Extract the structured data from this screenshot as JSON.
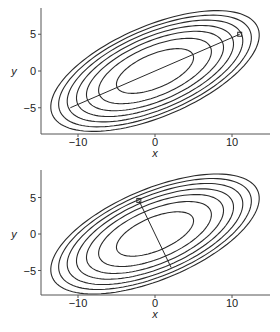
{
  "chart_data": [
    {
      "type": "contour",
      "title": "",
      "xlabel": "x",
      "ylabel": "y",
      "xlim": [
        -14.8,
        14.9
      ],
      "ylim": [
        -8.5,
        8.5
      ],
      "xticks": [
        -10,
        0,
        10
      ],
      "xtick_labels": [
        "−10",
        "0",
        "10"
      ],
      "yticks": [
        -5,
        0,
        5
      ],
      "ytick_labels": [
        "−5",
        "0",
        "5"
      ],
      "grid": false,
      "ellipses": {
        "center": [
          0,
          0
        ],
        "angle_deg": 24.4,
        "semi_major": [
          5.4,
          7.9,
          9.6,
          11.0,
          12.3,
          13.5,
          14.6
        ],
        "minor_ratio": 0.42
      },
      "line": {
        "from": [
          -11,
          -5
        ],
        "to": [
          11,
          5
        ],
        "marker_at": "to",
        "description": "major axis"
      }
    },
    {
      "type": "contour",
      "title": "",
      "xlabel": "x",
      "ylabel": "y",
      "xlim": [
        -14.8,
        14.9
      ],
      "ylim": [
        -8.5,
        8.5
      ],
      "xticks": [
        -10,
        0,
        10
      ],
      "xtick_labels": [
        "−10",
        "0",
        "10"
      ],
      "yticks": [
        -5,
        0,
        5
      ],
      "ytick_labels": [
        "−5",
        "0",
        "5"
      ],
      "grid": false,
      "ellipses": {
        "center": [
          0,
          0
        ],
        "angle_deg": 24.4,
        "semi_major": [
          5.4,
          7.9,
          9.6,
          11.0,
          12.3,
          13.5,
          14.6
        ],
        "minor_ratio": 0.42
      },
      "line": {
        "from": [
          2.1,
          -4.6
        ],
        "to": [
          -2.1,
          4.6
        ],
        "marker_at": "to",
        "description": "minor axis"
      }
    }
  ],
  "panels": [
    {
      "xlabel": "x",
      "ylabel": "y"
    },
    {
      "xlabel": "x",
      "ylabel": "y"
    }
  ],
  "colors": {
    "line": "#2a2a2a",
    "axis": "#555555",
    "text": "#222222"
  }
}
